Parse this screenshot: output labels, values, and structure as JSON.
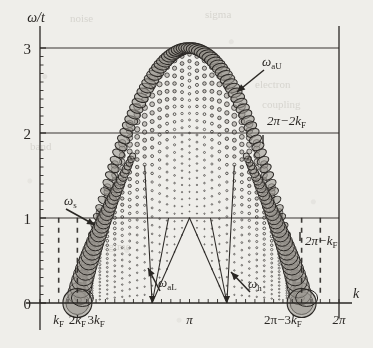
{
  "figure": {
    "background_color": "#efeeea",
    "ink_color": "#2a2724",
    "fill_color": "#9a968f",
    "axis_labels": {
      "y": "ω/t",
      "x": "k"
    }
  },
  "axes": {
    "y_ticks": [
      {
        "value": 0,
        "label": "0"
      },
      {
        "value": 1,
        "label": "1"
      },
      {
        "value": 2,
        "label": "2"
      },
      {
        "value": 3,
        "label": "3"
      }
    ],
    "x_ticks": [
      {
        "value": 0.3927,
        "label": "kᶠ",
        "text": "kF"
      },
      {
        "value": 0.7854,
        "label": "2kᶠ",
        "text": "2kF"
      },
      {
        "value": 1.1781,
        "label": "3kᶠ",
        "text": "3kF"
      },
      {
        "value": 3.1416,
        "label": "π",
        "text": "pi"
      },
      {
        "value": 5.1051,
        "label": "2π−3kᶠ",
        "text": "2pi-3kF"
      },
      {
        "value": 6.2832,
        "label": "2π",
        "text": "2pi"
      }
    ],
    "y_range": [
      -0.22,
      3.35
    ],
    "x_range": [
      0,
      6.2832
    ],
    "grid": "horizontal-only"
  },
  "annotations": [
    {
      "id": "omega-aU",
      "label": "ωₐᴜ",
      "base": "ω",
      "sub": "aU",
      "x_px": 262,
      "y_px": 66,
      "arrow_to_x": 237,
      "arrow_to_y": 92
    },
    {
      "id": "2pi-2kF",
      "label": "2π−2kᶠ",
      "base": "2π−2k",
      "sub": "F",
      "x_px": 267,
      "y_px": 125,
      "tick_x": 263,
      "tick_y": 135
    },
    {
      "id": "omega-s",
      "label": "ωₛ",
      "base": "ω",
      "sub": "s",
      "x_px": 64,
      "y_px": 205,
      "arrow_to_x": 95,
      "arrow_to_y": 225
    },
    {
      "id": "omega-aL",
      "label": "ωₐʟ",
      "base": "ω",
      "sub": "aL",
      "x_px": 158,
      "y_px": 287,
      "arrow_to_x": 148,
      "arrow_to_y": 268
    },
    {
      "id": "omega-h",
      "label": "ωₕ",
      "base": "ω",
      "sub": "h",
      "x_px": 248,
      "y_px": 288,
      "arrow_to_x": 231,
      "arrow_to_y": 272
    },
    {
      "id": "2pi-kF",
      "label": "2π−kᶠ",
      "base": "2π−k",
      "sub": "F",
      "x_px": 305,
      "y_px": 245,
      "tick_x": 300,
      "tick_y": 232
    }
  ],
  "chart_data": {
    "type": "scatter",
    "title": "",
    "xlabel": "k",
    "ylabel": "ω/t",
    "xlim": [
      0,
      6.2832
    ],
    "ylim": [
      -0.22,
      3.35
    ],
    "grid": true,
    "legend": "none",
    "branches": [
      {
        "name": "ω_aU",
        "type": "upper-boundary",
        "peak_k": 3.1416,
        "peak_omega": 3.0,
        "zero_k": [
          0.3927,
          5.8905
        ]
      },
      {
        "name": "ω_s",
        "type": "flank",
        "zero_k": [
          0.3927,
          5.8905
        ],
        "omega_at_kF": 0.0
      },
      {
        "name": "ω_aL",
        "type": "lower-V",
        "zero_k": [
          1.1781,
          5.1051
        ],
        "apex_k": 3.1416,
        "apex_omega": 1.0
      },
      {
        "name": "ω_h",
        "type": "lower-V",
        "zero_k": [
          1.1781,
          5.1051
        ],
        "apex_k": 3.1416,
        "apex_omega": 1.0
      }
    ],
    "gridline_omegas": [
      1,
      2,
      3
    ],
    "dashed_markers_k": [
      0.3927,
      0.7854,
      5.4978,
      5.8905
    ],
    "series": [
      {
        "name": "upper-boundary-weights",
        "comment": "radius proportional to spectral weight; maximal near k=k_F and k=2π−k_F at ω=0, and large along the dome crest"
      }
    ]
  },
  "ghost_text": [
    {
      "text": "noise",
      "x": 70,
      "y": 22
    },
    {
      "text": "sigma",
      "x": 205,
      "y": 18
    },
    {
      "text": "electron",
      "x": 255,
      "y": 88
    },
    {
      "text": "coupling",
      "x": 262,
      "y": 108
    },
    {
      "text": "regime",
      "x": 100,
      "y": 250
    },
    {
      "text": "band",
      "x": 30,
      "y": 150
    }
  ]
}
